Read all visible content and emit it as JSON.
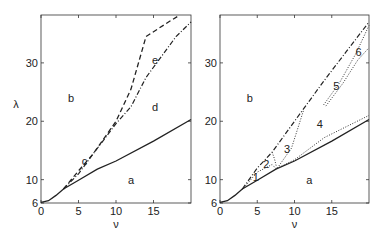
{
  "chart_data": [
    {
      "type": "line",
      "title": "",
      "xlabel": "ν",
      "ylabel": "λ",
      "xlim": [
        0,
        20
      ],
      "ylim": [
        6,
        38.2
      ],
      "xticks": [
        "0",
        "5",
        "10",
        "15"
      ],
      "yticks": [
        "6",
        "10",
        "20",
        "30"
      ],
      "grid": false,
      "legend": null,
      "region_labels": [
        {
          "text": "a",
          "nu": 12,
          "lambda": 10
        },
        {
          "text": "b",
          "nu": 4,
          "lambda": 24
        },
        {
          "text": "c",
          "nu": 5.8,
          "lambda": 13.2
        },
        {
          "text": "d",
          "nu": 15.2,
          "lambda": 22.5
        },
        {
          "text": "e",
          "nu": 15.2,
          "lambda": 30.5
        }
      ],
      "series": [
        {
          "name": "solid",
          "style": "solid",
          "points": [
            [
              0,
              6.1
            ],
            [
              1,
              6.4
            ],
            [
              2,
              7.3
            ],
            [
              3,
              8.4
            ],
            [
              5,
              9.9
            ],
            [
              7.5,
              11.8
            ],
            [
              10,
              13.2
            ],
            [
              15,
              16.6
            ],
            [
              20,
              20.3
            ]
          ]
        },
        {
          "name": "dashed",
          "style": "dashed",
          "points": [
            [
              3,
              8.4
            ],
            [
              5,
              11.5
            ],
            [
              7,
              14.5
            ],
            [
              10,
              20
            ],
            [
              12,
              25.5
            ],
            [
              14,
              34.5
            ],
            [
              17,
              37
            ],
            [
              18.5,
              38.2
            ]
          ]
        },
        {
          "name": "dash-dot",
          "style": "dashdot",
          "points": [
            [
              3,
              8.4
            ],
            [
              5,
              11
            ],
            [
              7,
              14.5
            ],
            [
              10,
              19.6
            ],
            [
              12,
              22.5
            ],
            [
              14,
              27.5
            ],
            [
              18,
              34.5
            ],
            [
              20,
              37
            ]
          ]
        }
      ]
    },
    {
      "type": "line",
      "title": "",
      "xlabel": "ν",
      "ylabel": "",
      "xlim": [
        0,
        20
      ],
      "ylim": [
        6,
        38.2
      ],
      "xticks": [
        "0",
        "5",
        "10",
        "15"
      ],
      "yticks": [
        "6",
        "10",
        "20",
        "30"
      ],
      "grid": false,
      "legend": null,
      "region_labels": [
        {
          "text": "a",
          "nu": 12,
          "lambda": 10
        },
        {
          "text": "b",
          "nu": 4,
          "lambda": 24
        },
        {
          "text": "1",
          "nu": 4.8,
          "lambda": 10.5
        },
        {
          "text": "2",
          "nu": 6.2,
          "lambda": 12.6
        },
        {
          "text": "3",
          "nu": 9,
          "lambda": 15.3
        },
        {
          "text": "4",
          "nu": 13.4,
          "lambda": 19.6
        },
        {
          "text": "5",
          "nu": 15.6,
          "lambda": 26
        },
        {
          "text": "6",
          "nu": 18.6,
          "lambda": 31.8
        }
      ],
      "series": [
        {
          "name": "solid",
          "style": "solid",
          "points": [
            [
              0,
              6.1
            ],
            [
              1,
              6.4
            ],
            [
              2,
              7.3
            ],
            [
              3,
              8.4
            ],
            [
              5,
              9.9
            ],
            [
              7.5,
              11.8
            ],
            [
              10,
              13.2
            ],
            [
              15,
              16.6
            ],
            [
              20,
              20.3
            ]
          ]
        },
        {
          "name": "dash-dot",
          "style": "dashdot",
          "points": [
            [
              3,
              8.4
            ],
            [
              5,
              12
            ],
            [
              7,
              14.7
            ],
            [
              10,
              20
            ],
            [
              14,
              27
            ],
            [
              17,
              32
            ],
            [
              20,
              37
            ]
          ]
        },
        {
          "name": "dotted-1-2",
          "style": "dotted",
          "points": [
            [
              3,
              8.3
            ],
            [
              5,
              11.3
            ],
            [
              7,
              12.6
            ],
            [
              7.5,
              11.9
            ]
          ]
        },
        {
          "name": "dotted-2-3",
          "style": "dotted",
          "points": [
            [
              7,
              14.7
            ],
            [
              7.3,
              13.6
            ],
            [
              7.6,
              12.1
            ]
          ]
        },
        {
          "name": "dotted-3-4",
          "style": "dotted",
          "points": [
            [
              7.7,
              12
            ],
            [
              9.6,
              15.4
            ],
            [
              11.2,
              21.8
            ]
          ]
        },
        {
          "name": "dotted-4-a",
          "style": "dotted",
          "points": [
            [
              7.6,
              11.9
            ],
            [
              10,
              13.4
            ],
            [
              14,
              17.2
            ],
            [
              20,
              21
            ]
          ]
        },
        {
          "name": "dotted-5a",
          "style": "dotted",
          "points": [
            [
              13.9,
              22.8
            ],
            [
              16,
              26.5
            ],
            [
              18.2,
              31.5
            ],
            [
              20,
              36.4
            ]
          ]
        },
        {
          "name": "dotted-5b",
          "style": "dotted",
          "points": [
            [
              14.2,
              22.6
            ],
            [
              16.5,
              26.5
            ],
            [
              18.5,
              30.5
            ],
            [
              20,
              32.6
            ]
          ]
        }
      ]
    }
  ]
}
